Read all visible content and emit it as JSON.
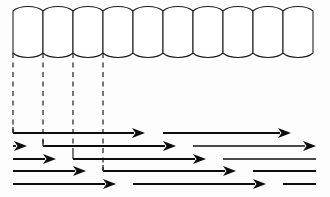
{
  "figure": {
    "background_color": "#fdfdfd",
    "ink_color": "#0d0d0d",
    "cell_stroke_color": "#1a1a1a",
    "dash_color": "#141414",
    "width": 330,
    "height": 197
  },
  "cell_row": {
    "name": "cylinder-cell-row",
    "count": 10,
    "x_start": 13,
    "x_end": 313,
    "cell_width": 30,
    "y_top": 11,
    "y_bottom": 53,
    "bulge": 6,
    "cells": [
      {
        "index": 1,
        "x": 13
      },
      {
        "index": 2,
        "x": 43
      },
      {
        "index": 3,
        "x": 73
      },
      {
        "index": 4,
        "x": 103
      },
      {
        "index": 5,
        "x": 133
      },
      {
        "index": 6,
        "x": 163
      },
      {
        "index": 7,
        "x": 193
      },
      {
        "index": 8,
        "x": 223
      },
      {
        "index": 9,
        "x": 253
      },
      {
        "index": 10,
        "x": 283
      }
    ]
  },
  "drop_lines": {
    "name": "dashed-projection-lines",
    "count": 4,
    "y_top": 53,
    "lines": [
      {
        "index": 1,
        "x": 13,
        "y_bottom": 132
      },
      {
        "index": 2,
        "x": 43,
        "y_bottom": 144
      },
      {
        "index": 3,
        "x": 73,
        "y_bottom": 157
      },
      {
        "index": 4,
        "x": 103,
        "y_bottom": 170
      }
    ]
  },
  "arrow_rows": [
    {
      "index": 1,
      "y": 133,
      "segments": [
        {
          "kind": "arrow",
          "x1": 13,
          "x2": 145,
          "thickness": 2.0,
          "start_tick": true
        },
        {
          "kind": "arrow",
          "x1": 163,
          "x2": 291,
          "thickness": 1.8,
          "start_tick": false
        }
      ]
    },
    {
      "index": 2,
      "y": 146,
      "segments": [
        {
          "kind": "arrow",
          "x1": 13,
          "x2": 27,
          "thickness": 1.8,
          "start_tick": false
        },
        {
          "kind": "arrow",
          "x1": 43,
          "x2": 176,
          "thickness": 2.0,
          "start_tick": true
        },
        {
          "kind": "arrow",
          "x1": 193,
          "x2": 316,
          "thickness": 1.6,
          "start_tick": false
        }
      ]
    },
    {
      "index": 3,
      "y": 159,
      "segments": [
        {
          "kind": "arrow",
          "x1": 13,
          "x2": 56,
          "thickness": 2.0,
          "start_tick": false
        },
        {
          "kind": "arrow",
          "x1": 73,
          "x2": 206,
          "thickness": 2.0,
          "start_tick": true
        },
        {
          "kind": "line",
          "x1": 223,
          "x2": 316,
          "thickness": 1.6,
          "start_tick": false
        }
      ]
    },
    {
      "index": 4,
      "y": 171,
      "segments": [
        {
          "kind": "arrow",
          "x1": 13,
          "x2": 86,
          "thickness": 2.1,
          "start_tick": false
        },
        {
          "kind": "arrow",
          "x1": 103,
          "x2": 236,
          "thickness": 2.0,
          "start_tick": true
        },
        {
          "kind": "line",
          "x1": 253,
          "x2": 316,
          "thickness": 1.8,
          "start_tick": false
        }
      ]
    },
    {
      "index": 5,
      "y": 184,
      "segments": [
        {
          "kind": "arrow",
          "x1": 13,
          "x2": 116,
          "thickness": 2.1,
          "start_tick": false
        },
        {
          "kind": "arrow",
          "x1": 133,
          "x2": 266,
          "thickness": 2.0,
          "start_tick": false
        },
        {
          "kind": "line",
          "x1": 283,
          "x2": 316,
          "thickness": 1.8,
          "start_tick": false
        }
      ]
    }
  ],
  "arrowhead": {
    "length": 13,
    "half_width": 5
  }
}
